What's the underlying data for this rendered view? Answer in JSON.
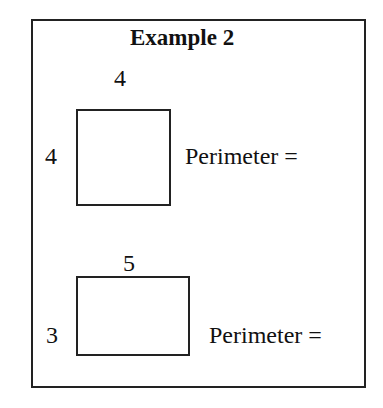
{
  "title": "Example 2",
  "shapes": [
    {
      "type": "square",
      "top_label": "4",
      "side_label": "4",
      "caption": "Perimeter ="
    },
    {
      "type": "rectangle",
      "top_label": "5",
      "side_label": "3",
      "caption": "Perimeter ="
    }
  ]
}
